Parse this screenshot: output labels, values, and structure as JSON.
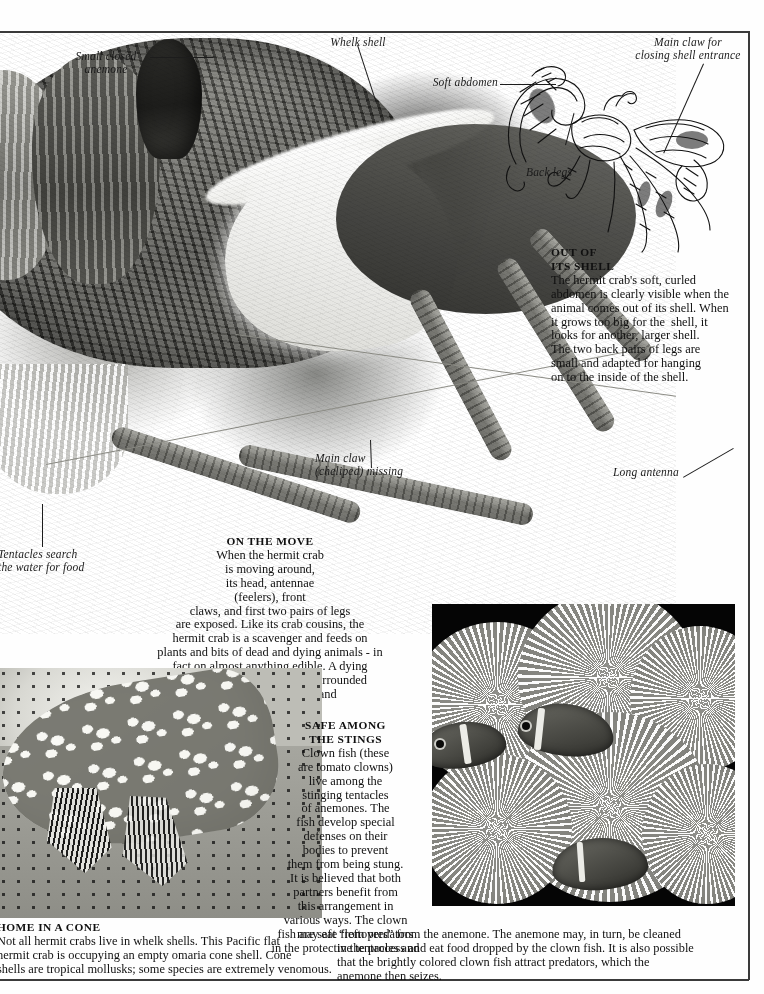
{
  "page": {
    "subject": "Hermit crabs",
    "background_color": "#ffffff",
    "rule_color": "#3a3a3a"
  },
  "labels": [
    {
      "name": "small-closed-anemone",
      "text": "Small closed\nanemone"
    },
    {
      "name": "whelk-shell",
      "text": "Whelk shell"
    },
    {
      "name": "soft-abdomen",
      "text": "Soft abdomen"
    },
    {
      "name": "main-claw-for-closing-shell-entrance",
      "text": "Main claw for\nclosing shell entrance"
    },
    {
      "name": "back-legs",
      "text": "Back legs"
    },
    {
      "name": "main-claw-cheliped-missing",
      "text": "Main claw\n(cheliped) missing"
    },
    {
      "name": "long-antenna",
      "text": "Long antenna"
    },
    {
      "name": "tentacles-search-the-water-for-food",
      "text": "Tentacles search\nthe water for food"
    }
  ],
  "captions": {
    "out_of_its_shell": {
      "heading_lines": [
        "OUT OF",
        "ITS SHELL"
      ],
      "body_lines": [
        "The hermit crab's soft, curled",
        "abdomen is clearly visible when the",
        "animal comes out of its shell. When",
        "it grows too big for the  shell, it",
        "looks for another, larger shell.",
        "The two back pairs of legs are",
        "small and adapted for hanging",
        "on to the inside of the shell."
      ]
    },
    "on_the_move": {
      "heading_lines": [
        "ON THE MOVE"
      ],
      "body_lines": [
        "When the hermit crab",
        "is moving around,",
        "its head, antennae",
        "(feelers), front",
        "claws, and first two pairs of legs",
        "are exposed. Like its crab cousins, the",
        "hermit crab is a scavenger and feeds on",
        "plants and bits of dead and dying animals - in",
        "fact on almost anything edible. A dying",
        "animal on the shore is soon surrounded",
        "by many crabs picking and",
        "pulling at its flesh."
      ]
    },
    "safe_among_the_stings": {
      "heading_lines": [
        "SAFE AMONG",
        "THE STINGS"
      ],
      "body_lines": [
        "Clown fish (these",
        "are tomato clowns)",
        "live among the",
        "stinging tentacles",
        "of anemones. The",
        "fish develop special",
        "defenses on their",
        "bodies to prevent",
        "them from being stung.",
        "It is believed that both",
        "partners benefit from",
        "this arrangement in",
        "various ways. The clown",
        "fish are safe from predators",
        "in the protective tentacles and"
      ],
      "runover_lines": [
        "may eat “leftovers” from the anemone. The anemone may, in turn, be cleaned",
        "in the process and eat food dropped by the clown fish. It is also possible",
        "that the brightly colored clown fish attract predators, which the",
        "anemone then seizes."
      ]
    },
    "home_in_a_cone": {
      "heading_lines": [
        "HOME IN A CONE"
      ],
      "body_lines": [
        "Not all hermit crabs live in whelk shells. This Pacific flat",
        "hermit crab is occupying an empty omaria cone shell. Cone",
        "shells are tropical mollusks; some species are extremely venomous."
      ]
    }
  },
  "figures": {
    "hermit_crab_in_whelk_shell": "photograph-hermit-crab-in-whelk-shell-with-anemones",
    "hermit_crab_out_of_shell": "line-engraving-hermit-crab-removed-from-shell",
    "pacific_flat_hermit_crab": "photograph-pacific-flat-hermit-crab-in-omaria-cone-shell",
    "clownfish_in_anemone": "photograph-tomato-clownfish-among-anemone-tentacles"
  }
}
